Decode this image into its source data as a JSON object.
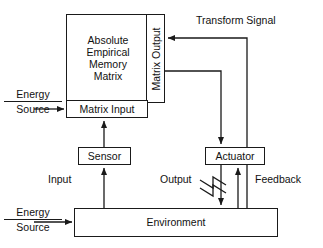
{
  "diagram": {
    "stroke_color": "#1a1a1a",
    "background_color": "#ffffff"
  },
  "blocks": {
    "matrix": {
      "lines": [
        "Absolute",
        "Empirical",
        "Memory",
        "Matrix"
      ],
      "line1": "Absolute",
      "line2": "Empirical",
      "line3": "Memory",
      "line4": "Matrix"
    },
    "matrix_output": {
      "label": "Matrix Output"
    },
    "matrix_input": {
      "label": "Matrix Input"
    },
    "sensor": {
      "label": "Sensor"
    },
    "actuator": {
      "label": "Actuator"
    },
    "environment": {
      "label": "Environment"
    }
  },
  "energy_sources": [
    {
      "line1": "Energy",
      "line2": "Source"
    },
    {
      "line1": "Energy",
      "line2": "Source"
    }
  ],
  "edge_labels": {
    "transform_signal": "Transform Signal",
    "input": "Input",
    "output": "Output",
    "feedback": "Feedback"
  },
  "symbols": {
    "output_modulation": "zigzag-icon"
  }
}
